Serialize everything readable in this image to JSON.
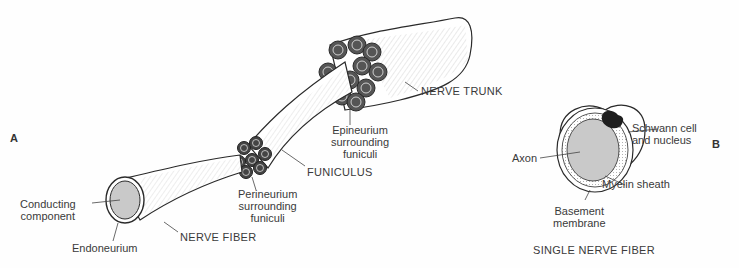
{
  "panels": {
    "a": {
      "letter": "A",
      "labels": {
        "conducting_component": [
          "Conducting",
          "component"
        ],
        "endoneurium": "Endoneurium",
        "nerve_fiber": "NERVE FIBER",
        "perineurium": [
          "Perineurium",
          "surrounding",
          "funiculi"
        ],
        "funiculus": "FUNICULUS",
        "epineurium": [
          "Epineurium",
          "surrounding",
          "funiculi"
        ],
        "nerve_trunk": "NERVE TRUNK"
      }
    },
    "b": {
      "letter": "B",
      "title": "SINGLE NERVE FIBER",
      "labels": {
        "axon": "Axon",
        "schwann": [
          "Schwann cell",
          "and nucleus"
        ],
        "myelin": "Myelin sheath",
        "basement": [
          "Basement",
          "membrane"
        ]
      }
    }
  },
  "colors": {
    "ink": "#2a2a2a",
    "fill_gray": "#c9c9c9",
    "paper": "#fefefe"
  }
}
